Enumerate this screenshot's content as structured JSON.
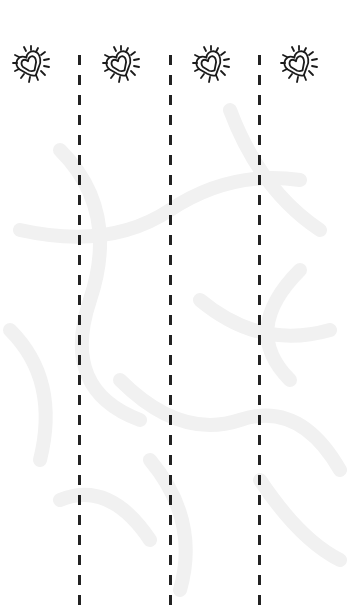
{
  "worksheet": {
    "type": "scissor-cutting-practice",
    "colors": {
      "line": "#222222",
      "icon_stroke": "#1a1a1a",
      "background_pattern": "#f1f1f1"
    },
    "icons": [
      {
        "name": "virus-heart-icon",
        "x": 10,
        "y": 43
      },
      {
        "name": "virus-heart-icon",
        "x": 100,
        "y": 43
      },
      {
        "name": "virus-heart-icon",
        "x": 190,
        "y": 43
      },
      {
        "name": "virus-heart-icon",
        "x": 278,
        "y": 43
      }
    ],
    "cut_lines": [
      {
        "x": 78,
        "top": 55,
        "bottom": 612
      },
      {
        "x": 169,
        "top": 55,
        "bottom": 612
      },
      {
        "x": 258,
        "top": 55,
        "bottom": 612
      }
    ]
  }
}
